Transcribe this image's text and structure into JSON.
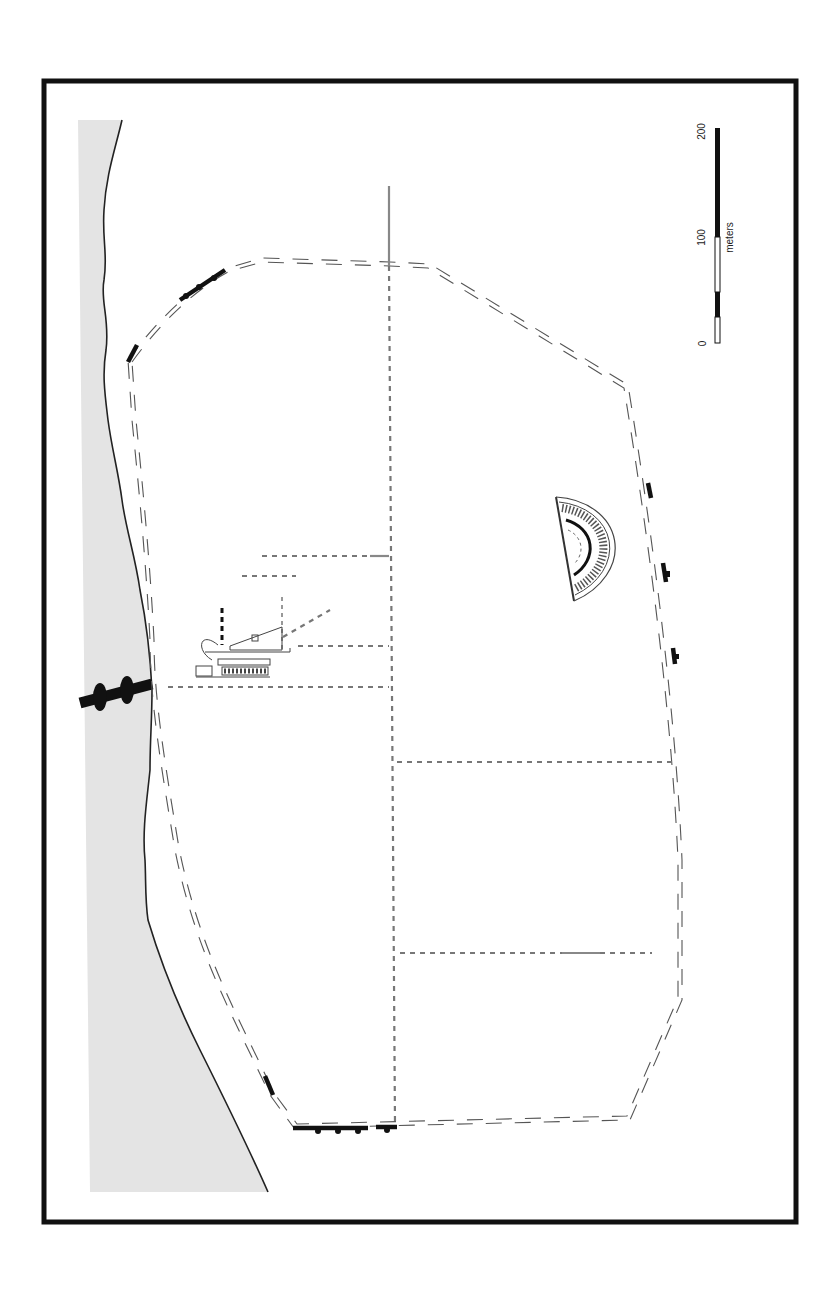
{
  "map": {
    "title": "",
    "orientation": "rotated-90",
    "colors": {
      "frame": "#111111",
      "sea": "#e4e4e4",
      "coastline": "#222222",
      "wall": "#555555",
      "street": "#777777",
      "excavated": "#111111"
    },
    "features": [
      {
        "name": "sea",
        "type": "area"
      },
      {
        "name": "coastline",
        "type": "line"
      },
      {
        "name": "city-wall",
        "type": "double-dashed-line"
      },
      {
        "name": "excavated-wall-segments",
        "type": "solid-line"
      },
      {
        "name": "harbor-mole",
        "type": "solid-line"
      },
      {
        "name": "street-grid",
        "type": "dashed-line"
      },
      {
        "name": "theater",
        "type": "semicircle-plan"
      },
      {
        "name": "harbor-building-complex",
        "type": "plan"
      }
    ]
  },
  "scale_bar": {
    "unit": "meters",
    "ticks": [
      "0",
      "100",
      "200"
    ],
    "segments": [
      {
        "from": 0,
        "to": 25,
        "fill": "white"
      },
      {
        "from": 25,
        "to": 50,
        "fill": "black"
      },
      {
        "from": 50,
        "to": 100,
        "fill": "white"
      },
      {
        "from": 100,
        "to": 200,
        "fill": "black"
      }
    ]
  }
}
